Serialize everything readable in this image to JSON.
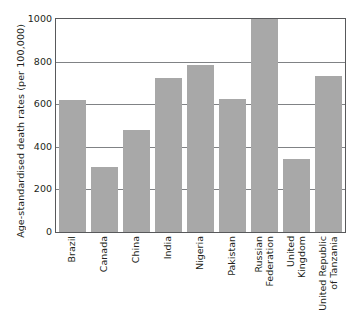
{
  "chart_data": {
    "type": "bar",
    "title": "",
    "xlabel": "",
    "ylabel": "Age-standardised death rates (per 100,000)",
    "ylim": [
      0,
      1000
    ],
    "yticks": [
      0,
      200,
      400,
      600,
      800,
      1000
    ],
    "ytick_labels": [
      "0",
      "200",
      "400",
      "600",
      "800",
      "1000"
    ],
    "grid": true,
    "legend": "none",
    "bar_color": "#a8a8a8",
    "axis_color": "#58595b",
    "categories": [
      "Brazil",
      "Canada",
      "China",
      "India",
      "Nigeria",
      "Pakistan",
      "Russian\nFederation",
      "United\nKingdom",
      "United Republic\nof Tanzania"
    ],
    "values": [
      620,
      305,
      480,
      722,
      785,
      625,
      1000,
      343,
      732
    ]
  }
}
